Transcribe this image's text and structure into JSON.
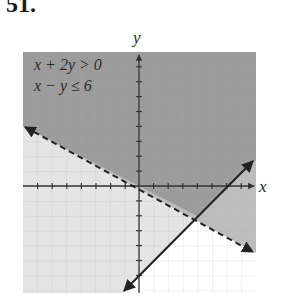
{
  "problem": {
    "number": "51."
  },
  "graph": {
    "x_axis_label": "x",
    "y_axis_label": "y",
    "x_range": [
      -8,
      8
    ],
    "y_range": [
      -7.2,
      8.9
    ],
    "unit_px_x": 14.6,
    "unit_px_y": 14.9,
    "origin_px": [
      139,
      186
    ],
    "inequalities": [
      {
        "text": "x + 2y > 0",
        "boundary": "x + 2y = 0",
        "style": "dashed"
      },
      {
        "text": "x − y ≤ 6",
        "boundary": "x − y = 6",
        "style": "solid"
      }
    ],
    "intersection": [
      4,
      -2
    ],
    "colors": {
      "overlap": "#9c9c9c",
      "first_only": "#bdbdbd",
      "second_only": "#e4e4e4",
      "neither": "#ffffff",
      "grid": "#b0b0b0",
      "axis": "#333333",
      "line": "#222222"
    }
  }
}
